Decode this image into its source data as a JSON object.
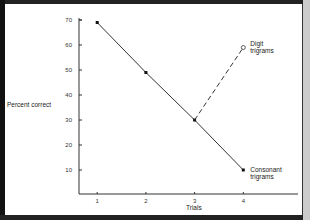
{
  "chart_data": {
    "type": "line",
    "title": "",
    "xlabel": "Trials",
    "ylabel": "Percent correct",
    "x": [
      1,
      2,
      3,
      4
    ],
    "xticks": [
      "1",
      "2",
      "3",
      "4"
    ],
    "yticks": [
      "10",
      "20",
      "30",
      "40",
      "50",
      "60",
      "70"
    ],
    "ylim": [
      0,
      70
    ],
    "xlim": [
      0.6,
      5.2
    ],
    "grid": false,
    "legend": "inline labels at line ends",
    "series": [
      {
        "name": "Consonant trigrams",
        "label_lines": [
          "Consonant",
          "trigrams"
        ],
        "style": "solid",
        "marker": "filled-square",
        "x": [
          1,
          2,
          3,
          4
        ],
        "values": [
          69,
          49,
          30,
          10
        ]
      },
      {
        "name": "Digit trigrams",
        "label_lines": [
          "Digit",
          "trigrams"
        ],
        "style": "dashed",
        "marker": "open-circle",
        "x": [
          3,
          4
        ],
        "values": [
          30,
          59
        ]
      }
    ],
    "colors": {
      "line": "#333333",
      "text": "#222222",
      "frame": "#111111"
    }
  }
}
